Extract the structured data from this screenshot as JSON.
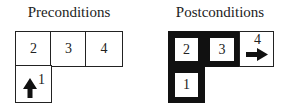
{
  "pre": {
    "title": "Preconditions",
    "cells": [
      {
        "label": "2"
      },
      {
        "label": "3"
      },
      {
        "label": "4"
      },
      {
        "label": "1"
      }
    ],
    "arrow": "up-arrow"
  },
  "post": {
    "title": "Postconditions",
    "cells": [
      {
        "label": "2"
      },
      {
        "label": "3"
      },
      {
        "label": "4"
      },
      {
        "label": "1"
      }
    ],
    "arrow": "right-arrow"
  }
}
